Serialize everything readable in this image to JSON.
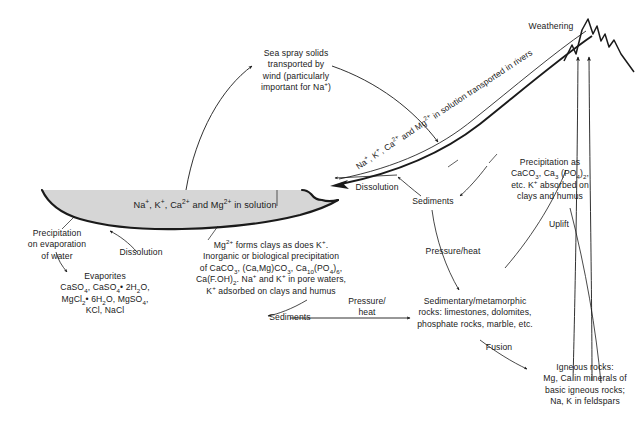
{
  "diagram": {
    "title_text": "Geochemical cycle of Na, K, Ca and Mg",
    "ocean_fill_color": "#d6d6d6",
    "stroke_color": "#1a1a1a",
    "background_color": "#ffffff",
    "labels": {
      "weathering": "Weathering",
      "sea_spray": "Sea spray solids\ntransported by\nwind (particularly\nimportant for Na⁺)",
      "river_transport": "Na⁺, K⁺, Ca²⁺ and Mg²⁺ in solution transported in rivers",
      "ocean_solution": "Na⁺, K⁺, Ca²⁺ and Mg²⁺ in solution",
      "dissolution_left": "Dissolution",
      "dissolution_right": "Dissolution",
      "precipitation_evaporation": "Precipitation\non evaporation\nof water",
      "evaporites": "Evaporites\nCaSO₄, CaSO₄• 2H₂O,\nMgCl₂• 6H₂O, MgSO₄,\nKCl, NaCl",
      "clays_precipitation": "Mg²⁺ forms clays as does K⁺.\nInorganic or biological precipitation\nof CaCO₃, (Ca,Mg)CO₃, Ca₁₀(PO₄)₆,\nCa(F.OH)₂. Na⁺ and K⁺ in pore waters,\nK⁺ adsorbed on clays and humus",
      "precipitation_as": "Precipitation as\nCaCO₃, Ca₃ (PO₄)₂,\netc. K⁺ absorbed on\nclays and humus",
      "sediments_right": "Sediments",
      "sediments_bottom": "Sediments",
      "pressure_heat_upper": "Pressure/heat",
      "pressure_heat_left": "Pressure/\nheat",
      "sedimentary_rocks": "Sedimentary/metamorphic\nrocks: limestones, dolomites,\nphosphate rocks, marble, etc.",
      "fusion": "Fusion",
      "igneous_rocks": "Igneous rocks:\nMg, Ca in minerals of\nbasic igneous rocks;\nNa, K in feldspars",
      "uplift": "Uplift"
    }
  }
}
